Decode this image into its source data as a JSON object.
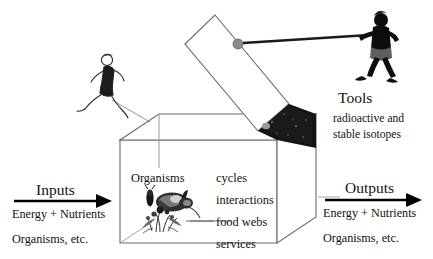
{
  "figure": {
    "background_color": "#ffffff",
    "ink_color": "#111111",
    "box_line_color": "#6b6b6b",
    "dark_panel_color": "#141414",
    "knob_color": "#8c8c8c"
  },
  "inputs": {
    "title": "Inputs",
    "line1": "Energy + Nutrients",
    "line2": "Organisms, etc.",
    "arrow_direction": "right"
  },
  "outputs": {
    "title": "Outputs",
    "line1": "Energy + Nutrients",
    "line2": "Organisms, etc.",
    "arrow_direction": "right"
  },
  "tools": {
    "title": "Tools",
    "line1": "radioactive and",
    "line2": "stable isotopes"
  },
  "box": {
    "organisms_label": "Organisms",
    "processes": [
      "cycles",
      "interactions",
      "food webs",
      "services"
    ]
  },
  "icons": {
    "runner": "runner-figure-icon",
    "puller": "rope-pulling-figure-icon",
    "organisms": "organisms-illustration-icon",
    "lid": "box-lid-icon",
    "knob": "lid-knob-icon",
    "rope": "rope-icon"
  }
}
